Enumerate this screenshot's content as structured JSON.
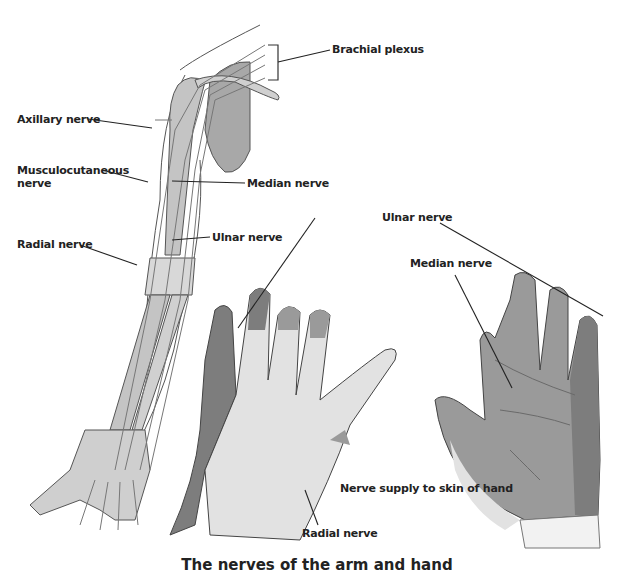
{
  "diagram": {
    "caption": "The nerves of the arm and hand",
    "arm_labels": {
      "brachial_plexus": "Brachial plexus",
      "axillary_nerve": "Axillary nerve",
      "musculocutaneous_line1": "Musculocutaneous",
      "musculocutaneous_line2": "nerve",
      "median_nerve": "Median nerve",
      "ulnar_nerve": "Ulnar nerve",
      "radial_nerve": "Radial nerve"
    },
    "hand_labels": {
      "ulnar_nerve": "Ulnar nerve",
      "median_nerve": "Median nerve",
      "radial_nerve": "Radial nerve",
      "nerve_supply": "Nerve supply to skin of hand"
    },
    "colors": {
      "ulnar_region": "#7d7d7d",
      "median_region": "#9a9a9a",
      "radial_region": "#e2e2e2",
      "bone": "#c4c4c4",
      "nerve": "#ededed",
      "outline": "#333333",
      "scapula": "#a8a8a8"
    }
  }
}
